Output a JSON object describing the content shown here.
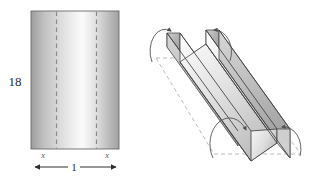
{
  "figure": {
    "left_diagram": {
      "name": "flat-sheet-rectangle",
      "height_label": "18",
      "width_label": "1",
      "fold_offset_label_left": "x",
      "fold_offset_label_right": "x",
      "fold_line_style": "dashed",
      "fold_line_count": 2,
      "fill_style": "gray-gradient",
      "border_color": "#666666",
      "dash_color": "#8f8f8f"
    },
    "right_diagram": {
      "name": "folded-gutter-3d",
      "description": "Open-top trough formed by folding the two side strips upward",
      "fold_arrow_count": 4,
      "outline_style": "dashed",
      "face_fill": "gray-gradient",
      "edge_color": "#4a4a4a",
      "dash_color": "#b0b0b0",
      "arrow_color": "#555555"
    },
    "colors": {
      "ink": "#2b2b2b",
      "edge": "#4a4a4a",
      "dash": "#a8a8a8",
      "gray_light": "#f2f2f2",
      "gray_mid": "#c9c9c9",
      "gray_dark": "#9a9a9a",
      "background": "#ffffff"
    }
  }
}
